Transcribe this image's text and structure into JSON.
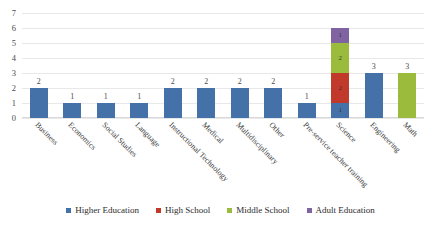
{
  "chart_data": {
    "type": "bar",
    "subtype": "stacked-column",
    "title": "",
    "xlabel": "",
    "ylabel": "",
    "ylim": [
      0,
      7
    ],
    "yticks": [
      0,
      1,
      2,
      3,
      4,
      5,
      6,
      7
    ],
    "grid": true,
    "legend_position": "bottom",
    "categories": [
      "Business",
      "Economics",
      "Social Studies",
      "Language",
      "Instructional Technology",
      "Medical",
      "Multidisciplinary",
      "Other",
      "Pre-service teacher training",
      "Science",
      "Engineering",
      "Math"
    ],
    "series": [
      {
        "name": "Higher Education",
        "color": "#4472A8",
        "values": [
          2,
          1,
          1,
          1,
          2,
          2,
          2,
          2,
          1,
          1,
          3,
          0
        ]
      },
      {
        "name": "High School",
        "color": "#C0392B",
        "values": [
          0,
          0,
          0,
          0,
          0,
          0,
          0,
          0,
          0,
          2,
          0,
          0
        ]
      },
      {
        "name": "Middle School",
        "color": "#9BBB3C",
        "values": [
          0,
          0,
          0,
          0,
          0,
          0,
          0,
          0,
          0,
          2,
          0,
          3
        ]
      },
      {
        "name": "Adult Education",
        "color": "#8064A2",
        "values": [
          0,
          0,
          0,
          0,
          0,
          0,
          0,
          0,
          0,
          1,
          0,
          0
        ]
      }
    ],
    "totals": [
      2,
      1,
      1,
      1,
      2,
      2,
      2,
      2,
      1,
      6,
      3,
      3
    ],
    "data_labels": {
      "show_total_above_single_series": true,
      "show_segment_values_inside_stack": true
    }
  }
}
